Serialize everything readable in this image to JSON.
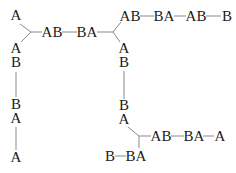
{
  "diagram": {
    "type": "tree-graph",
    "nodes": [
      {
        "id": "n1",
        "label": "A",
        "x": 16,
        "y": 20
      },
      {
        "id": "n2",
        "label": "AB",
        "x": 52,
        "y": 37
      },
      {
        "id": "n3",
        "label": "BA",
        "x": 87,
        "y": 37
      },
      {
        "id": "n4",
        "label": "AB",
        "x": 130,
        "y": 21
      },
      {
        "id": "n5",
        "label": "BA",
        "x": 164,
        "y": 21
      },
      {
        "id": "n6",
        "label": "AB",
        "x": 196,
        "y": 21
      },
      {
        "id": "n7",
        "label": "B",
        "x": 227,
        "y": 21
      },
      {
        "id": "n8",
        "label": "A",
        "x": 16,
        "y": 53
      },
      {
        "id": "n9",
        "label": "B",
        "x": 16,
        "y": 67
      },
      {
        "id": "n10",
        "label": "B",
        "x": 16,
        "y": 109
      },
      {
        "id": "n11",
        "label": "A",
        "x": 16,
        "y": 123
      },
      {
        "id": "n12",
        "label": "A",
        "x": 16,
        "y": 162
      },
      {
        "id": "n13",
        "label": "A",
        "x": 124,
        "y": 53
      },
      {
        "id": "n14",
        "label": "B",
        "x": 124,
        "y": 67
      },
      {
        "id": "n15",
        "label": "B",
        "x": 124,
        "y": 110
      },
      {
        "id": "n16",
        "label": "A",
        "x": 124,
        "y": 124
      },
      {
        "id": "n17",
        "label": "AB",
        "x": 161,
        "y": 141
      },
      {
        "id": "n18",
        "label": "BA",
        "x": 194,
        "y": 141
      },
      {
        "id": "n19",
        "label": "A",
        "x": 220,
        "y": 141
      },
      {
        "id": "n20",
        "label": "B",
        "x": 110,
        "y": 161
      },
      {
        "id": "n21",
        "label": "BA",
        "x": 136,
        "y": 161
      }
    ]
  }
}
